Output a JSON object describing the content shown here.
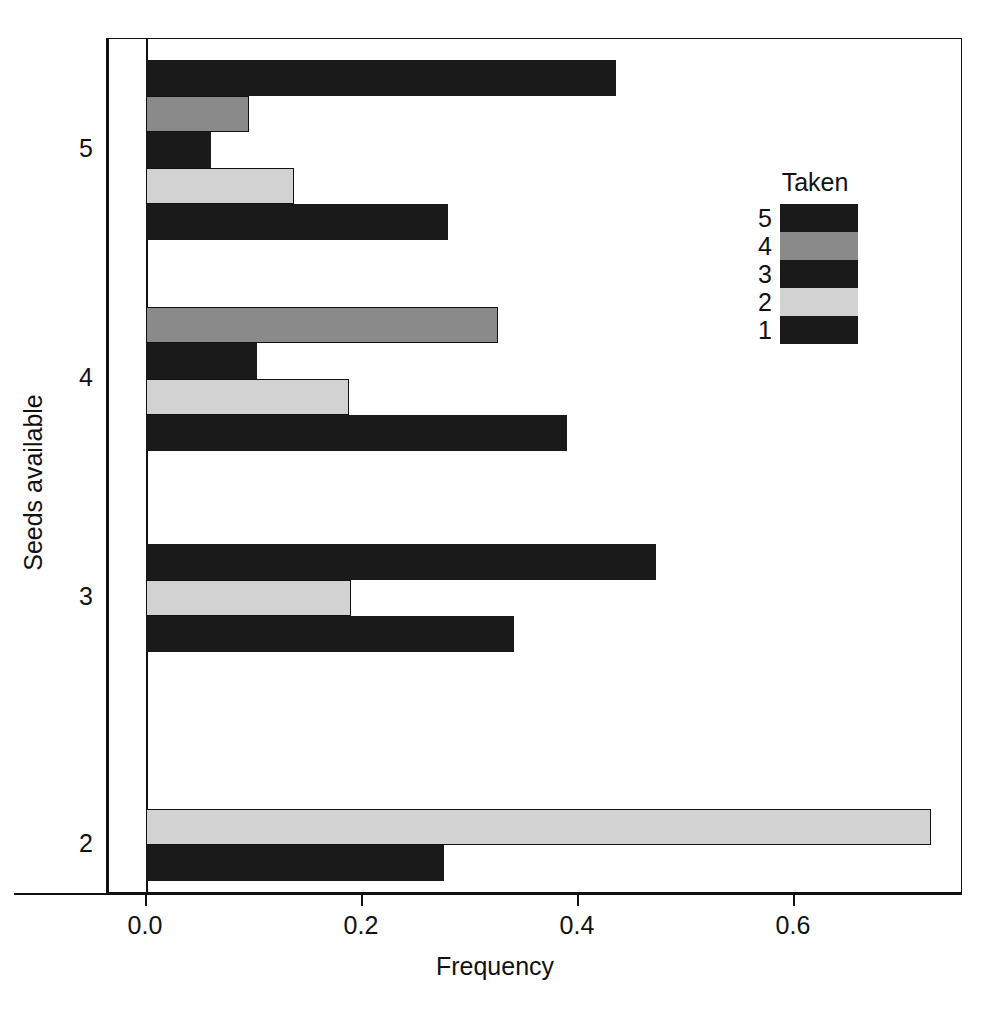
{
  "chart_data": {
    "type": "bar",
    "orientation": "horizontal",
    "title": "",
    "xlabel": "Frequency",
    "ylabel": "Seeds available",
    "xlim": [
      0.0,
      0.757
    ],
    "xticks": [
      0.0,
      0.2,
      0.4,
      0.6
    ],
    "xtick_labels": [
      "0.0",
      "0.2",
      "0.4",
      "0.6"
    ],
    "yticks": [
      2,
      3,
      4,
      5
    ],
    "ytick_labels": [
      "2",
      "3",
      "4",
      "5"
    ],
    "grid": false,
    "legend": {
      "title": "Taken",
      "position": "upper right",
      "entries": [
        {
          "label": "5",
          "color": "#1a1a1a"
        },
        {
          "label": "4",
          "color": "#8a8a8a"
        },
        {
          "label": "3",
          "color": "#1a1a1a"
        },
        {
          "label": "2",
          "color": "#d2d2d2"
        },
        {
          "label": "1",
          "color": "#1a1a1a"
        }
      ]
    },
    "groups": [
      {
        "category": "5",
        "bars": [
          {
            "taken": "5",
            "value": 0.435,
            "color": "#1a1a1a"
          },
          {
            "taken": "4",
            "value": 0.095,
            "color": "#8a8a8a"
          },
          {
            "taken": "3",
            "value": 0.06,
            "color": "#1a1a1a"
          },
          {
            "taken": "2",
            "value": 0.137,
            "color": "#d2d2d2"
          },
          {
            "taken": "1",
            "value": 0.28,
            "color": "#1a1a1a"
          }
        ]
      },
      {
        "category": "4",
        "bars": [
          {
            "taken": "4",
            "value": 0.326,
            "color": "#8a8a8a"
          },
          {
            "taken": "3",
            "value": 0.103,
            "color": "#1a1a1a"
          },
          {
            "taken": "2",
            "value": 0.188,
            "color": "#d2d2d2"
          },
          {
            "taken": "1",
            "value": 0.39,
            "color": "#1a1a1a"
          }
        ]
      },
      {
        "category": "3",
        "bars": [
          {
            "taken": "3",
            "value": 0.472,
            "color": "#1a1a1a"
          },
          {
            "taken": "2",
            "value": 0.19,
            "color": "#d2d2d2"
          },
          {
            "taken": "1",
            "value": 0.341,
            "color": "#1a1a1a"
          }
        ]
      },
      {
        "category": "2",
        "bars": [
          {
            "taken": "2",
            "value": 0.727,
            "color": "#d2d2d2"
          },
          {
            "taken": "1",
            "value": 0.276,
            "color": "#1a1a1a"
          }
        ]
      }
    ]
  },
  "axes": {
    "x_title": "Frequency",
    "y_title": "Seeds available"
  }
}
